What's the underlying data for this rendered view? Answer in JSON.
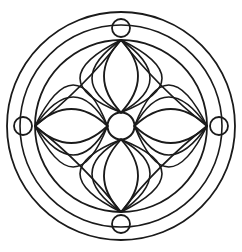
{
  "artwork": {
    "title": "Circular Floral Mandala Line Drawing",
    "kind": "line-art-rosette",
    "background_color": "#ffffff",
    "stroke_color": "#1a1a1a",
    "canvas": {
      "width": 242,
      "height": 252
    },
    "center": {
      "x": 121,
      "y": 126
    }
  },
  "rings": [
    {
      "name": "outer-ring-outer-edge",
      "label": "Outer border circle",
      "radius": 114,
      "stroke_width": 1.8
    },
    {
      "name": "outer-ring-inner-edge",
      "label": "Inner border circle",
      "radius": 101,
      "stroke_width": 1.6
    },
    {
      "name": "main-field-circle",
      "label": "Main field circle",
      "radius": 86,
      "stroke_width": 1.8
    }
  ],
  "hub": {
    "name": "center-hub-circle",
    "label": "Center hub",
    "radius": 13.5,
    "stroke_width": 2.0
  },
  "cardinal_nodes": [
    {
      "name": "node-top",
      "label": "Top node circle",
      "angle_deg": -90,
      "cx": 121,
      "cy": 28,
      "radius": 9.0,
      "stroke_width": 1.8
    },
    {
      "name": "node-right",
      "label": "Right node circle",
      "angle_deg": 0,
      "cx": 219,
      "cy": 126,
      "radius": 9.0,
      "stroke_width": 1.8
    },
    {
      "name": "node-bottom",
      "label": "Bottom node circle",
      "angle_deg": 90,
      "cx": 121,
      "cy": 224,
      "radius": 9.0,
      "stroke_width": 1.8
    },
    {
      "name": "node-left",
      "label": "Left node circle",
      "angle_deg": 180,
      "cx": 23,
      "cy": 126,
      "radius": 9.0,
      "stroke_width": 1.8
    }
  ],
  "petals": [
    {
      "name": "petal-top",
      "label": "Top petal",
      "tip_angle_deg": -90,
      "tip": {
        "x": 121,
        "y": 40
      },
      "half_width": 34,
      "stroke_width": 1.8
    },
    {
      "name": "petal-right",
      "label": "Right petal",
      "tip_angle_deg": 0,
      "tip": {
        "x": 207,
        "y": 126
      },
      "half_width": 34,
      "stroke_width": 1.8
    },
    {
      "name": "petal-bottom",
      "label": "Bottom petal",
      "tip_angle_deg": 90,
      "tip": {
        "x": 121,
        "y": 212
      },
      "half_width": 34,
      "stroke_width": 1.8
    },
    {
      "name": "petal-left",
      "label": "Left petal",
      "tip_angle_deg": 180,
      "tip": {
        "x": 35,
        "y": 126
      },
      "half_width": 34,
      "stroke_width": 1.8
    }
  ],
  "fan_arcs": {
    "label": "Fan arcs spanning from each petal tip toward neighbouring petal tips",
    "count_per_tip": 2,
    "stroke_width": 1.6,
    "spread_offsets": [
      58,
      82
    ]
  },
  "geometry_notes": {
    "radial_spokes_at_hub": 12,
    "symmetry": "4-fold rotational",
    "petal_count": 4,
    "node_count": 4
  }
}
